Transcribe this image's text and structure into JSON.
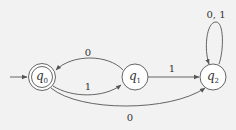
{
  "diagram": {
    "type": "finite-automaton",
    "states": [
      {
        "id": "q0",
        "name": "q",
        "sub": "0",
        "initial": true,
        "accepting": true
      },
      {
        "id": "q1",
        "name": "q",
        "sub": "1",
        "initial": false,
        "accepting": false
      },
      {
        "id": "q2",
        "name": "q",
        "sub": "2",
        "initial": false,
        "accepting": false
      }
    ],
    "transitions": [
      {
        "from": "q1",
        "to": "q0",
        "label": "0"
      },
      {
        "from": "q0",
        "to": "q1",
        "label": "1"
      },
      {
        "from": "q1",
        "to": "q2",
        "label": "1"
      },
      {
        "from": "q0",
        "to": "q2",
        "label": "0"
      },
      {
        "from": "q2",
        "to": "q2",
        "label": "0, 1"
      }
    ],
    "colors": {
      "background": "#f2f2f2",
      "stroke": "#555555",
      "text": "#333333",
      "state_fill": "#ffffff"
    }
  }
}
